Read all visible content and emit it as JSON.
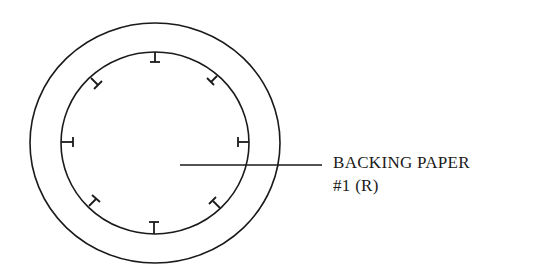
{
  "diagram": {
    "labels": {
      "line1": "BACKING PAPER",
      "line2": "#1 (R)"
    },
    "outer_circle": {
      "cx": 155,
      "cy": 143,
      "rx": 125,
      "ry": 120
    },
    "inner_circle": {
      "cx": 155,
      "cy": 143,
      "rx": 94,
      "ry": 91
    },
    "tab_count": 8,
    "stroke_color": "#1a1a1a"
  }
}
